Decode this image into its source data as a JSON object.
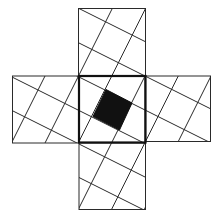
{
  "diagram": {
    "width": 221,
    "height": 218,
    "colors": {
      "background": "#ffffff",
      "line": "#2a2a2a",
      "thick_border": "#111111",
      "fill": "#111111"
    },
    "squares": [
      {
        "name": "top-square",
        "x": 78.5,
        "y": 8.5,
        "size": 67,
        "thick": false
      },
      {
        "name": "left-square",
        "x": 12.5,
        "y": 76,
        "size": 67,
        "thick": false
      },
      {
        "name": "right-square",
        "x": 145,
        "y": 76,
        "size": 65.5,
        "thick": false
      },
      {
        "name": "bottom-square",
        "x": 79,
        "y": 143,
        "size": 66.5,
        "thick": false
      },
      {
        "name": "center-square",
        "x": 79,
        "y": 76,
        "size": 66.5,
        "thick": true
      }
    ],
    "grid_lines": {
      "shallow": {
        "slope": 0.5,
        "intercepts": [
          -31,
          3.5,
          37.5,
          71,
          104.5,
          138
        ]
      },
      "steep": {
        "slope": -2,
        "intercepts": [
          166,
          233,
          299.5,
          366,
          432.5,
          498
        ]
      }
    },
    "tilted_square": {
      "name": "shaded-center-square",
      "points": [
        [
          106,
          89.5
        ],
        [
          132,
          103
        ],
        [
          119.5,
          130
        ],
        [
          93,
          116.5
        ]
      ]
    }
  }
}
